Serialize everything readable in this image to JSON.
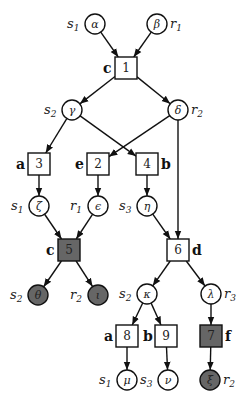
{
  "diagram": {
    "colors": {
      "stroke": "#111111",
      "filled": "#666666",
      "background": "#ffffff"
    },
    "circles": [
      {
        "id": "alpha",
        "greek": "α",
        "cx": 95,
        "cy": 24,
        "filled": false,
        "side": "left",
        "var": "s",
        "sub": "1"
      },
      {
        "id": "beta",
        "greek": "β",
        "cx": 157,
        "cy": 24,
        "filled": false,
        "side": "right",
        "var": "r",
        "sub": "1"
      },
      {
        "id": "gamma",
        "greek": "γ",
        "cx": 72,
        "cy": 110,
        "filled": false,
        "side": "left",
        "var": "s",
        "sub": "2"
      },
      {
        "id": "delta",
        "greek": "δ",
        "cx": 178,
        "cy": 110,
        "filled": false,
        "side": "right",
        "var": "r",
        "sub": "2"
      },
      {
        "id": "zeta",
        "greek": "ζ",
        "cx": 39,
        "cy": 206,
        "filled": false,
        "side": "left",
        "var": "s",
        "sub": "1"
      },
      {
        "id": "epsilon",
        "greek": "ϵ",
        "cx": 98,
        "cy": 206,
        "filled": false,
        "side": "left",
        "var": "r",
        "sub": "1"
      },
      {
        "id": "eta",
        "greek": "η",
        "cx": 147,
        "cy": 206,
        "filled": false,
        "side": "left",
        "var": "s",
        "sub": "3"
      },
      {
        "id": "theta",
        "greek": "θ",
        "cx": 38,
        "cy": 295,
        "filled": true,
        "side": "left",
        "var": "s",
        "sub": "2"
      },
      {
        "id": "iota",
        "greek": "ι",
        "cx": 98,
        "cy": 295,
        "filled": true,
        "side": "left",
        "var": "r",
        "sub": "2"
      },
      {
        "id": "kappa",
        "greek": "κ",
        "cx": 147,
        "cy": 294,
        "filled": false,
        "side": "left",
        "var": "s",
        "sub": "2"
      },
      {
        "id": "lambda",
        "greek": "λ",
        "cx": 211,
        "cy": 294,
        "filled": false,
        "side": "right",
        "var": "r",
        "sub": "3"
      },
      {
        "id": "mu",
        "greek": "μ",
        "cx": 127,
        "cy": 380,
        "filled": false,
        "side": "left",
        "var": "s",
        "sub": "1"
      },
      {
        "id": "nu",
        "greek": "ν",
        "cx": 168,
        "cy": 380,
        "filled": false,
        "side": "left",
        "var": "s",
        "sub": "3"
      },
      {
        "id": "xi",
        "greek": "ξ",
        "cx": 210,
        "cy": 380,
        "filled": true,
        "side": "right",
        "var": "r",
        "sub": "2"
      }
    ],
    "boxes": [
      {
        "id": "b1",
        "num": "1",
        "cx": 126,
        "cy": 68,
        "filled": false,
        "tag": "c",
        "tagSide": "left"
      },
      {
        "id": "b3",
        "num": "3",
        "cx": 39,
        "cy": 164,
        "filled": false,
        "tag": "a",
        "tagSide": "left"
      },
      {
        "id": "b2",
        "num": "2",
        "cx": 98,
        "cy": 164,
        "filled": false,
        "tag": "e",
        "tagSide": "left"
      },
      {
        "id": "b4",
        "num": "4",
        "cx": 147,
        "cy": 164,
        "filled": false,
        "tag": "b",
        "tagSide": "right"
      },
      {
        "id": "b5",
        "num": "5",
        "cx": 69,
        "cy": 250,
        "filled": true,
        "tag": "c",
        "tagSide": "left"
      },
      {
        "id": "b6",
        "num": "6",
        "cx": 178,
        "cy": 250,
        "filled": false,
        "tag": "d",
        "tagSide": "right"
      },
      {
        "id": "b8",
        "num": "8",
        "cx": 127,
        "cy": 336,
        "filled": false,
        "tag": "a",
        "tagSide": "left"
      },
      {
        "id": "b9",
        "num": "9",
        "cx": 166,
        "cy": 336,
        "filled": false,
        "tag": "b",
        "tagSide": "left"
      },
      {
        "id": "b7",
        "num": "7",
        "cx": 211,
        "cy": 336,
        "filled": true,
        "tag": "f",
        "tagSide": "right"
      }
    ],
    "edges": [
      [
        "alpha",
        "b1"
      ],
      [
        "beta",
        "b1"
      ],
      [
        "b1",
        "gamma"
      ],
      [
        "b1",
        "delta"
      ],
      [
        "gamma",
        "b3"
      ],
      [
        "gamma",
        "b4"
      ],
      [
        "delta",
        "b2"
      ],
      [
        "delta",
        "b6"
      ],
      [
        "b3",
        "zeta"
      ],
      [
        "b2",
        "epsilon"
      ],
      [
        "b4",
        "eta"
      ],
      [
        "zeta",
        "b5"
      ],
      [
        "epsilon",
        "b5"
      ],
      [
        "eta",
        "b6"
      ],
      [
        "b5",
        "theta"
      ],
      [
        "b5",
        "iota"
      ],
      [
        "b6",
        "kappa"
      ],
      [
        "b6",
        "lambda"
      ],
      [
        "kappa",
        "b8"
      ],
      [
        "kappa",
        "b9"
      ],
      [
        "lambda",
        "b7"
      ],
      [
        "b8",
        "mu"
      ],
      [
        "b9",
        "nu"
      ],
      [
        "b7",
        "xi"
      ]
    ]
  }
}
